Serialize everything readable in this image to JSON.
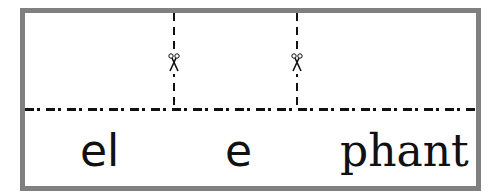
{
  "worksheet": {
    "word": "elephant",
    "syllables": [
      {
        "text": "el"
      },
      {
        "text": "e"
      },
      {
        "text": "phant"
      }
    ],
    "cut_lines": [
      {
        "icon": "scissors-icon"
      },
      {
        "icon": "scissors-icon"
      }
    ],
    "colors": {
      "border": "#808080",
      "line": "#111111",
      "text": "#111111"
    }
  }
}
